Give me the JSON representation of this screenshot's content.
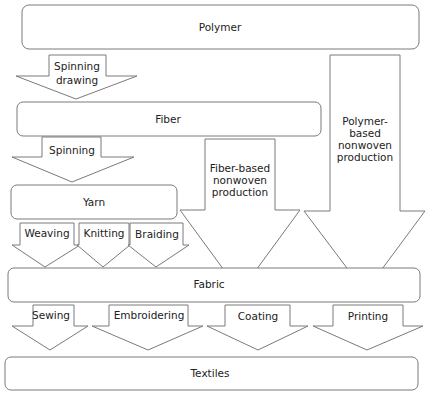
{
  "diagram": {
    "nodes": {
      "polymer": "Polymer",
      "fiber": "Fiber",
      "yarn": "Yarn",
      "fabric": "Fabric",
      "textiles": "Textiles"
    },
    "arrows": {
      "spinning_drawing": [
        "Spinning",
        "drawing"
      ],
      "spinning": "Spinning",
      "weaving": "Weaving",
      "knitting": "Knitting",
      "braiding": "Braiding",
      "fiber_nonwoven": [
        "Fiber-based",
        "nonwoven",
        "production"
      ],
      "polymer_nonwoven": [
        "Polymer-",
        "based",
        "nonwoven",
        "production"
      ],
      "sewing": "Sewing",
      "embroidering": "Embroidering",
      "coating": "Coating",
      "printing": "Printing"
    },
    "colors": {
      "stroke": "#7a7a7a",
      "text": "#222222",
      "fill": "#ffffff"
    }
  }
}
